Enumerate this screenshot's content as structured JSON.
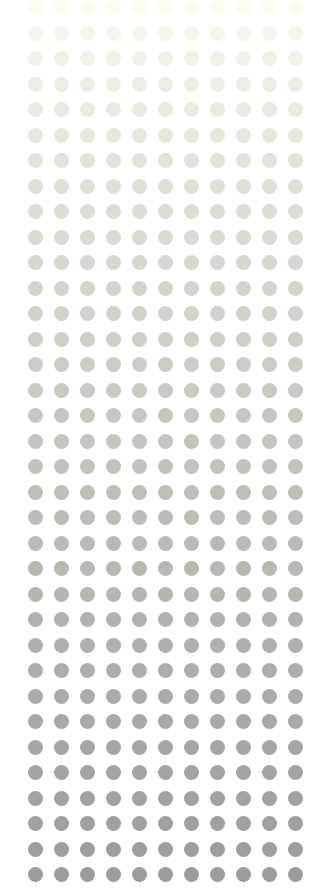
{
  "pattern": {
    "type": "dot-grid-gradient",
    "columns": 11,
    "rows": 35,
    "x_start": 28,
    "y_start": 0,
    "pitch_x": 26,
    "pitch_y": 25.5,
    "dot_diameter": 15,
    "color_top": "#fbfbee",
    "color_bottom": "#9c9c98",
    "background": "#ffffff"
  }
}
